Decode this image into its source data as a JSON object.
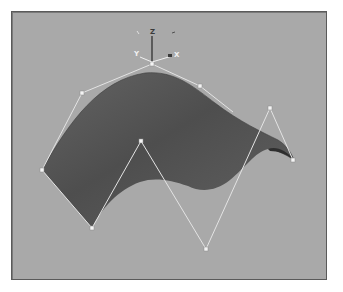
{
  "viewport": {
    "background_color": "#a9a9a9",
    "border_color": "#5a5a5a"
  },
  "surface": {
    "color_dark": "#4a4a4a",
    "color_mid": "#5c5c5c",
    "color_light": "#6e6e6e"
  },
  "control_polygon": {
    "line_color": "#e4e4e4",
    "point_color": "#f4f4f4"
  },
  "gizmo": {
    "z_label": "Z",
    "y_label": "Y",
    "x_label": "X"
  }
}
